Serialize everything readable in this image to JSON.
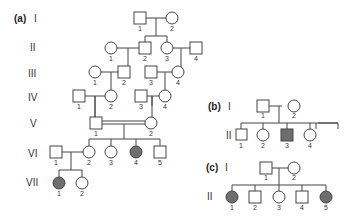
{
  "colors": {
    "affected": "#6e6e6e",
    "unaffected": "#ffffff",
    "line": "#444444"
  },
  "panels": {
    "a": {
      "label": "(a)",
      "generations": [
        "I",
        "II",
        "III",
        "IV",
        "V",
        "VI",
        "VII"
      ],
      "individuals": {
        "I": [
          {
            "n": "1",
            "sex": "male",
            "affected": false
          },
          {
            "n": "2",
            "sex": "female",
            "affected": false
          }
        ],
        "II": [
          {
            "n": "1",
            "sex": "female",
            "affected": false
          },
          {
            "n": "2",
            "sex": "male",
            "affected": false
          },
          {
            "n": "3",
            "sex": "female",
            "affected": false
          },
          {
            "n": "4",
            "sex": "male",
            "affected": false
          }
        ],
        "III": [
          {
            "n": "1",
            "sex": "female",
            "affected": false
          },
          {
            "n": "2",
            "sex": "male",
            "affected": false
          },
          {
            "n": "3",
            "sex": "male",
            "affected": false
          },
          {
            "n": "4",
            "sex": "female",
            "affected": false
          }
        ],
        "IV": [
          {
            "n": "1",
            "sex": "male",
            "affected": false
          },
          {
            "n": "2",
            "sex": "female",
            "affected": false
          },
          {
            "n": "3",
            "sex": "male",
            "affected": false
          },
          {
            "n": "4",
            "sex": "female",
            "affected": false
          }
        ],
        "V": [
          {
            "n": "1",
            "sex": "male",
            "affected": false
          },
          {
            "n": "2",
            "sex": "female",
            "affected": false
          }
        ],
        "VI": [
          {
            "n": "1",
            "sex": "male",
            "affected": false
          },
          {
            "n": "2",
            "sex": "female",
            "affected": false
          },
          {
            "n": "3",
            "sex": "female",
            "affected": false
          },
          {
            "n": "4",
            "sex": "female",
            "affected": true
          },
          {
            "n": "5",
            "sex": "male",
            "affected": false
          }
        ],
        "VII": [
          {
            "n": "1",
            "sex": "female",
            "affected": true
          },
          {
            "n": "2",
            "sex": "female",
            "affected": false
          }
        ]
      },
      "consanguineous_mating": "V-1 x V-2"
    },
    "b": {
      "label": "(b)",
      "generations": [
        "I",
        "II"
      ],
      "individuals": {
        "I": [
          {
            "n": "1",
            "sex": "male",
            "affected": false
          },
          {
            "n": "2",
            "sex": "female",
            "affected": false
          }
        ],
        "II": [
          {
            "n": "1",
            "sex": "male",
            "affected": false
          },
          {
            "n": "2",
            "sex": "female",
            "affected": false
          },
          {
            "n": "3",
            "sex": "male",
            "affected": true
          },
          {
            "n": "4",
            "sex": "female",
            "affected": false
          },
          {
            "n": "5",
            "sex": "female",
            "affected": true
          },
          {
            "n": "6",
            "sex": "female",
            "affected": true
          }
        ]
      }
    },
    "c": {
      "label": "(c)",
      "generations": [
        "I",
        "II"
      ],
      "individuals": {
        "I": [
          {
            "n": "1",
            "sex": "male",
            "affected": false
          },
          {
            "n": "2",
            "sex": "female",
            "affected": false
          }
        ],
        "II": [
          {
            "n": "1",
            "sex": "female",
            "affected": true
          },
          {
            "n": "2",
            "sex": "male",
            "affected": false
          },
          {
            "n": "3",
            "sex": "female",
            "affected": false
          },
          {
            "n": "4",
            "sex": "male",
            "affected": false
          },
          {
            "n": "5",
            "sex": "female",
            "affected": true
          }
        ]
      }
    }
  }
}
